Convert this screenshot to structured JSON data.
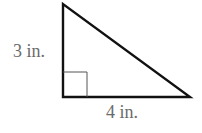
{
  "diagram": {
    "shape": "right-triangle",
    "vertical_leg_label": "3 in.",
    "horizontal_leg_label": "4 in.",
    "right_angle_marker": true,
    "colors": {
      "stroke": "#111111",
      "marker": "#555555",
      "label": "#6b6b6b"
    }
  }
}
